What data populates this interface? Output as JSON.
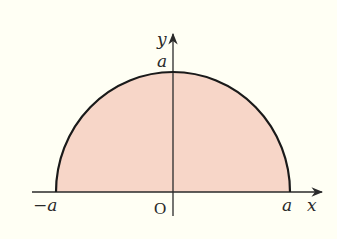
{
  "figure": {
    "type": "semicircle-region",
    "colors": {
      "background": "#fffff4",
      "fill": "#f7d6c8",
      "stroke": "#1a1a1a",
      "axis": "#2a2a2a"
    }
  },
  "axes": {
    "x_label": "x",
    "y_label": "y",
    "origin_label": "O"
  },
  "ticks": {
    "x_neg": "−a",
    "x_pos": "a",
    "y_pos": "a"
  }
}
